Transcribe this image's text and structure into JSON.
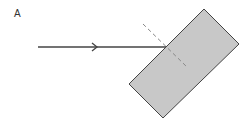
{
  "diagram": {
    "panel_label": "A",
    "colors": {
      "block_fill": "#c8c8c8",
      "block_stroke": "#444444",
      "ray": "#444444",
      "normal": "#888888"
    },
    "elements": {
      "incident_ray": {
        "from": [
          38,
          47
        ],
        "to": [
          166,
          47
        ],
        "arrow_at": [
          96,
          47
        ]
      },
      "glass_block": {
        "corners": [
          [
            204,
            9
          ],
          [
            239,
            44
          ],
          [
            163,
            118
          ],
          [
            129,
            84
          ]
        ]
      },
      "normal_line": {
        "from": [
          143,
          24
        ],
        "to": [
          188,
          68
        ],
        "style": "dashed"
      }
    }
  }
}
